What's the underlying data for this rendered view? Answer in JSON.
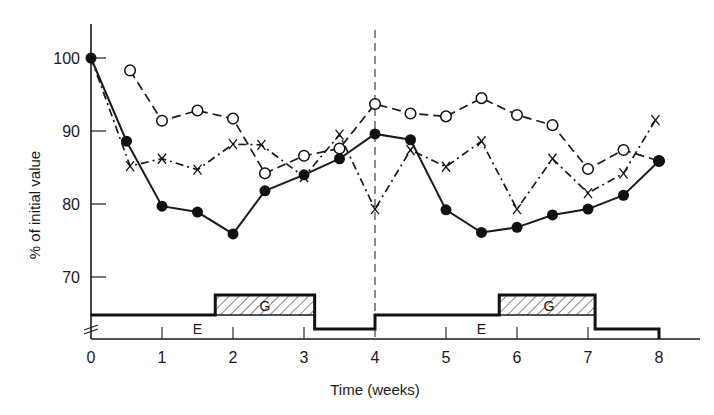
{
  "chart_data": {
    "type": "line",
    "title": "",
    "xlabel": "Time (weeks)",
    "ylabel": "% of initial value",
    "xlim": [
      0,
      8.7
    ],
    "ylim": [
      62,
      106
    ],
    "x_ticks": [
      0,
      1,
      2,
      3,
      4,
      5,
      6,
      7,
      8
    ],
    "x_tick_labels": [
      "0",
      "1",
      "2",
      "3",
      "4",
      "5",
      "6",
      "7",
      "8"
    ],
    "y_ticks": [
      70,
      80,
      90,
      100
    ],
    "y_tick_labels": [
      "70",
      "80",
      "90",
      "100"
    ],
    "y_axis_break": true,
    "grid": false,
    "legend": null,
    "vertical_reference_line": {
      "x": 4,
      "style": "dashed"
    },
    "series": [
      {
        "name": "filled-circles",
        "marker": "filled-circle",
        "line_style": "solid",
        "x": [
          0,
          0.5,
          1,
          1.5,
          2,
          2.45,
          3,
          3.5,
          4,
          4.5,
          5,
          5.5,
          6,
          6.5,
          7,
          7.5,
          8
        ],
        "values": [
          100,
          88.6,
          79.7,
          78.9,
          75.9,
          81.8,
          84.0,
          86.2,
          89.6,
          88.8,
          79.2,
          76.1,
          76.8,
          78.5,
          79.3,
          81.2,
          85.9
        ]
      },
      {
        "name": "open-circles",
        "marker": "open-circle",
        "line_style": "dashed",
        "x": [
          0.55,
          1,
          1.5,
          2,
          2.45,
          3,
          3.5,
          4,
          4.5,
          5,
          5.5,
          6,
          6.5,
          7,
          7.5,
          8
        ],
        "values": [
          98.3,
          91.4,
          92.8,
          91.7,
          84.2,
          86.6,
          87.6,
          93.7,
          92.4,
          92.0,
          94.5,
          92.2,
          90.8,
          84.8,
          87.4,
          85.9
        ]
      },
      {
        "name": "crosses",
        "marker": "x",
        "line_style": "dash-dot",
        "x": [
          0,
          0.55,
          1,
          1.5,
          2,
          2.4,
          3,
          3.5,
          4,
          4.5,
          5,
          5.5,
          6,
          6.5,
          7,
          7.5,
          7.95
        ],
        "values": [
          100,
          85.2,
          86.2,
          84.7,
          88.2,
          88.1,
          83.7,
          89.5,
          79.3,
          87.4,
          85.1,
          88.6,
          79.3,
          86.2,
          81.5,
          84.2,
          91.5
        ]
      }
    ],
    "annotations": [
      {
        "text": "E",
        "x": 1.5,
        "description": "baseline period segment label (first cycle)"
      },
      {
        "text": "G",
        "x": 2.45,
        "description": "hatched block label, weeks 1.75–3.15"
      },
      {
        "text": "E",
        "x": 5.5,
        "description": "baseline period segment label (second cycle)"
      },
      {
        "text": "G",
        "x": 6.45,
        "description": "hatched block label, weeks 5.75–7.1"
      }
    ],
    "regimen_bar": {
      "segments": [
        {
          "label": "E",
          "start": 0,
          "end": 1.75,
          "level": "mid"
        },
        {
          "label": "G",
          "start": 1.75,
          "end": 3.15,
          "level": "high",
          "hatched": true
        },
        {
          "label": "",
          "start": 3.15,
          "end": 4,
          "level": "low"
        },
        {
          "label": "E",
          "start": 4,
          "end": 5.75,
          "level": "mid"
        },
        {
          "label": "G",
          "start": 5.75,
          "end": 7.1,
          "level": "high",
          "hatched": true
        },
        {
          "label": "",
          "start": 7.1,
          "end": 8,
          "level": "low"
        }
      ]
    }
  }
}
